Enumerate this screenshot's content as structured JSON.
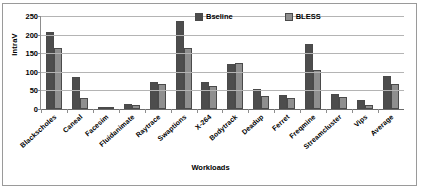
{
  "chart_data": {
    "type": "bar",
    "title": "",
    "xlabel": "Workloads",
    "ylabel": "IntraV",
    "ylim": [
      0,
      250
    ],
    "yticks": [
      0,
      50,
      100,
      150,
      200,
      250
    ],
    "grid": true,
    "legend_position": "top-right",
    "categories": [
      "Blackscholes",
      "Caneal",
      "Facesim",
      "Fluidanimate",
      "Raytrace",
      "Swaptions",
      "X-264",
      "Bodytrack",
      "Deadup",
      "Ferret",
      "Freqmine",
      "Streamcluster",
      "Vips",
      "Average"
    ],
    "series": [
      {
        "name": "Bseline",
        "color": "#4d4d4d",
        "values": [
          208,
          85,
          4,
          14,
          72,
          237,
          72,
          122,
          55,
          38,
          175,
          40,
          25,
          90
        ]
      },
      {
        "name": "BLESS",
        "color": "#8f8f8f",
        "values": [
          165,
          30,
          3,
          12,
          68,
          165,
          63,
          125,
          35,
          30,
          105,
          32,
          10,
          68
        ]
      }
    ]
  }
}
